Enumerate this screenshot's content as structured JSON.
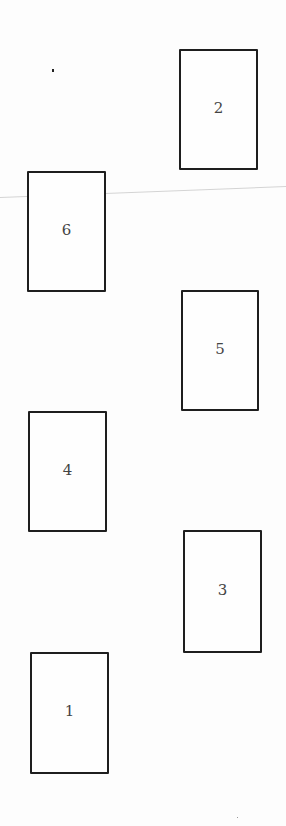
{
  "diagram": {
    "type": "numbered-box-layout",
    "boxes": [
      {
        "label": "2",
        "x": 179,
        "y": 49,
        "w": 79,
        "h": 121
      },
      {
        "label": "6",
        "x": 27,
        "y": 171,
        "w": 79,
        "h": 121
      },
      {
        "label": "5",
        "x": 181,
        "y": 290,
        "w": 78,
        "h": 121
      },
      {
        "label": "4",
        "x": 28,
        "y": 411,
        "w": 79,
        "h": 121
      },
      {
        "label": "3",
        "x": 183,
        "y": 530,
        "w": 79,
        "h": 123
      },
      {
        "label": "1",
        "x": 30,
        "y": 652,
        "w": 79,
        "h": 122
      }
    ],
    "colors": {
      "border": "#1e1e1e",
      "label": "#444444",
      "background": "#fdfdfd",
      "fold_line": "#d4d4d4"
    }
  }
}
